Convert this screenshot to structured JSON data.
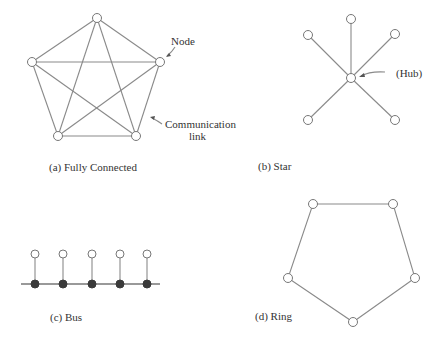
{
  "diagrams": {
    "fully_connected": {
      "caption": "(a) Fully Connected",
      "annotation_node": "Node",
      "annotation_link_1": "Communication",
      "annotation_link_2": "link",
      "nodes": [
        [
          97,
          18
        ],
        [
          32,
          62
        ],
        [
          160,
          62
        ],
        [
          58,
          136
        ],
        [
          136,
          136
        ]
      ]
    },
    "star": {
      "caption": "(b) Star",
      "annotation_hub": "(Hub)",
      "hub": [
        351,
        78
      ],
      "nodes": [
        [
          351,
          19
        ],
        [
          308,
          35
        ],
        [
          395,
          34
        ],
        [
          308,
          120
        ],
        [
          395,
          120
        ]
      ]
    },
    "bus": {
      "caption": "(c) Bus",
      "line": [
        [
          21,
          284
        ],
        [
          160,
          284
        ]
      ],
      "stations_x": [
        35,
        63,
        92,
        120,
        147
      ],
      "node_y": 254
    },
    "ring": {
      "caption": "(d) Ring",
      "nodes": [
        [
          313,
          204
        ],
        [
          393,
          204
        ],
        [
          415,
          278
        ],
        [
          353,
          322
        ],
        [
          288,
          278
        ]
      ]
    }
  },
  "colors": {
    "line": "#8a8a8a",
    "node_stroke": "#777777",
    "bus_dot": "#3a3a3a",
    "text": "#333333"
  }
}
